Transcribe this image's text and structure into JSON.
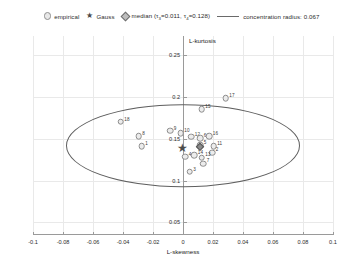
{
  "legend": {
    "empirical": {
      "label": "empirical",
      "icon": "circle-marker-icon"
    },
    "gauss": {
      "label": "Gauss",
      "icon": "star-marker-icon"
    },
    "median": {
      "label_prefix": "median (",
      "tau3_sym": "τ",
      "tau3_sub": "3",
      "tau3_eq": "=0.011, ",
      "tau4_sym": "τ",
      "tau4_sub": "4",
      "tau4_eq": "=0.128)",
      "icon": "diamond-marker-icon"
    },
    "concentration": {
      "label": "concentration radius: 0.067",
      "icon": "line-swatch-icon"
    }
  },
  "chart_data": {
    "type": "scatter",
    "title": "",
    "xlabel": "L-skewness",
    "ylabel": "L-kurtosis",
    "xlim": [
      -0.1,
      0.1
    ],
    "ylim": [
      0.035,
      0.273
    ],
    "xticks": [
      -0.1,
      -0.08,
      -0.06,
      -0.04,
      -0.02,
      0,
      0.02,
      0.04,
      0.06,
      0.08,
      0.1
    ],
    "xticklabels": [
      "-0.1",
      "-0.08",
      "-0.06",
      "-0.04",
      "-0.02",
      "0",
      "0.02",
      "0.04",
      "0.06",
      "0.08",
      "0.1"
    ],
    "yticks": [
      0.05,
      0.1,
      0.15,
      0.2,
      0.25
    ],
    "yticklabels": [
      "0.05",
      "0.1",
      "0.15",
      "0.2",
      "0.25"
    ],
    "grid": true,
    "legend_position": "top",
    "series": [
      {
        "name": "empirical",
        "marker": "circle",
        "points": [
          {
            "label": "18",
            "x": -0.0415,
            "y": 0.1705
          },
          {
            "label": "8",
            "x": -0.0295,
            "y": 0.1535
          },
          {
            "label": "1",
            "x": -0.0275,
            "y": 0.1415
          },
          {
            "label": "9",
            "x": -0.0085,
            "y": 0.1595
          },
          {
            "label": "10",
            "x": -0.0015,
            "y": 0.1565
          },
          {
            "label": "15",
            "x": 0.0125,
            "y": 0.1855
          },
          {
            "label": "17",
            "x": 0.0285,
            "y": 0.1985
          },
          {
            "label": "12",
            "x": 0.0055,
            "y": 0.1525
          },
          {
            "label": "6",
            "x": 0.0115,
            "y": 0.1505
          },
          {
            "label": "16",
            "x": 0.0175,
            "y": 0.1535
          },
          {
            "label": "5",
            "x": 0.0115,
            "y": 0.1425
          },
          {
            "label": "11",
            "x": 0.0205,
            "y": 0.1415
          },
          {
            "label": "2",
            "x": 0.0195,
            "y": 0.1335
          },
          {
            "label": "4",
            "x": 0.0015,
            "y": 0.1285
          },
          {
            "label": "14",
            "x": 0.0075,
            "y": 0.1305
          },
          {
            "label": "13",
            "x": 0.0125,
            "y": 0.1275
          },
          {
            "label": "7",
            "x": 0.0135,
            "y": 0.1205
          },
          {
            "label": "3",
            "x": 0.0045,
            "y": 0.1105
          }
        ]
      },
      {
        "name": "Gauss",
        "marker": "star",
        "points": [
          {
            "label": "",
            "x": -0.0005,
            "y": 0.1395
          }
        ]
      },
      {
        "name": "median",
        "marker": "diamond",
        "points": [
          {
            "label": "",
            "x": 0.011,
            "y": 0.14
          }
        ]
      }
    ],
    "concentration_ellipse": {
      "center_x": 0.0,
      "center_y": 0.142,
      "radius_x": 0.078,
      "radius_y": 0.05,
      "radius_value": 0.067
    }
  }
}
